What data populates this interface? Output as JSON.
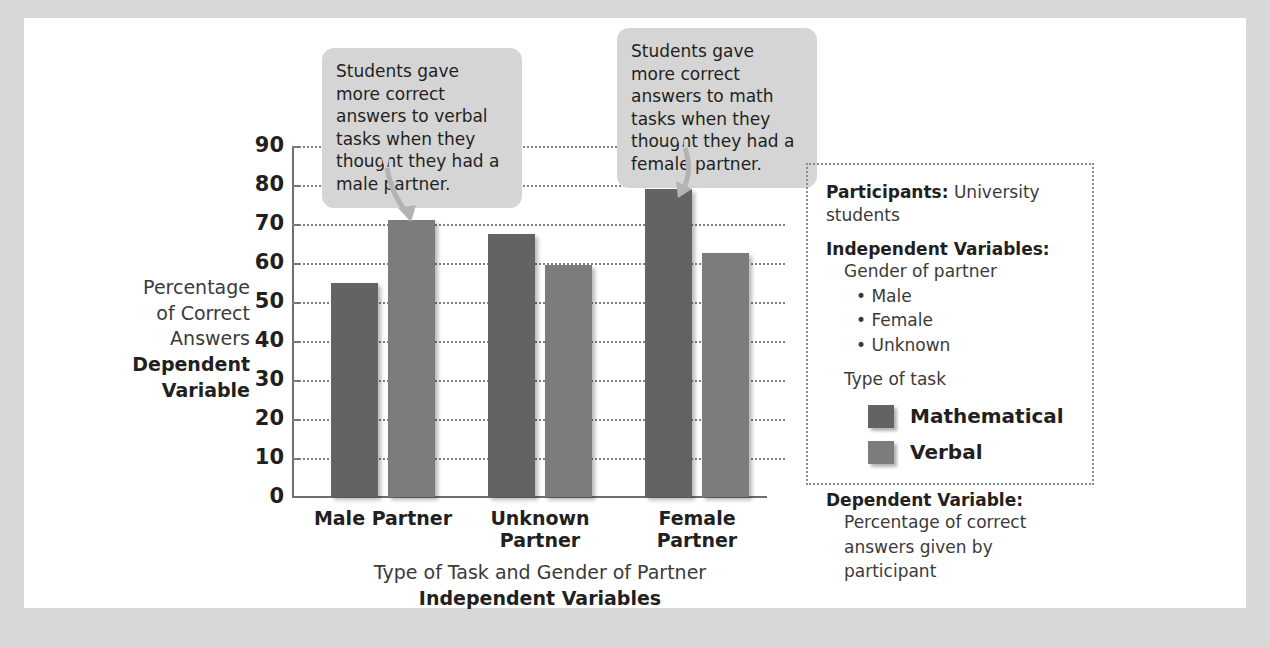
{
  "chart_data": {
    "type": "bar",
    "title": "",
    "xlabel": "Type of Task and Gender of Partner",
    "xlabel_bold": "Independent Variables",
    "ylabel": "Percentage of Correct Answers",
    "ylabel_bold": "Dependent Variable",
    "ylim": [
      0,
      90
    ],
    "ytick_step": 10,
    "yticks": [
      "90",
      "80",
      "70",
      "60",
      "50",
      "40",
      "30",
      "20",
      "10",
      "0"
    ],
    "grid": true,
    "legend_position": "right-info-box",
    "categories": [
      "Male Partner",
      "Unknown Partner",
      "Female Partner"
    ],
    "series": [
      {
        "name": "Mathematical",
        "color": "#636363",
        "values": [
          55,
          67.5,
          79
        ]
      },
      {
        "name": "Verbal",
        "color": "#7c7c7c",
        "values": [
          71,
          59.5,
          62.5
        ]
      }
    ],
    "annotations": [
      "Students gave more correct answers to verbal tasks when they thought they had a male partner.",
      "Students gave more correct answers to math tasks when they thought they had a female partner."
    ]
  },
  "callouts": [
    {
      "text": "Students gave more correct answers to verbal tasks when they thought they had a male partner."
    },
    {
      "text": "Students gave more correct answers to math tasks when they thought they had a female partner."
    }
  ],
  "info_box": {
    "participants_label": "Participants:",
    "participants_value": "University students",
    "independent_label": "Independent Variables:",
    "gender_line": "Gender of partner",
    "gender_options": [
      "Male",
      "Female",
      "Unknown"
    ],
    "task_line": "Type of task",
    "legend": [
      {
        "label": "Mathematical",
        "color": "#636363"
      },
      {
        "label": "Verbal",
        "color": "#7c7c7c"
      }
    ],
    "dependent_label": "Dependent Variable:",
    "dependent_line_1": "Percentage of correct",
    "dependent_line_2": "answers given by participant"
  },
  "axes": {
    "y_title_line_1": "Percentage",
    "y_title_line_2": "of Correct",
    "y_title_line_3": "Answers",
    "y_title_bold_1": "Dependent",
    "y_title_bold_2": "Variable",
    "x_title": "Type of Task and Gender of Partner",
    "x_title_bold": "Independent Variables"
  },
  "group_labels": [
    {
      "line1": "Male Partner",
      "line2": ""
    },
    {
      "line1": "Unknown",
      "line2": "Partner"
    },
    {
      "line1": "Female",
      "line2": "Partner"
    }
  ]
}
